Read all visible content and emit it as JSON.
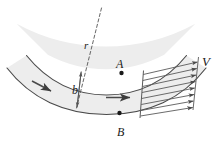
{
  "figure": {
    "labels": {
      "point_a": "A",
      "point_b": "B",
      "radius": "r",
      "width": "b",
      "velocity": "V"
    },
    "colors": {
      "fill": "#ededed",
      "stroke": "#4a4a4a",
      "arrow": "#4a4a4a",
      "dashed": "#555555",
      "text": "#1a1a1a",
      "background": "#ffffff"
    },
    "geometry": {
      "center_x": 106,
      "center_y": -62,
      "inner_radius": 124,
      "outer_radius": 186,
      "start_angle_deg": 118,
      "end_angle_deg": 58
    },
    "annotations": {
      "point_a_dot": "dot on inner (upper) wall at section A-B",
      "point_b_dot": "dot on outer (lower) wall at section A-B",
      "radius_line": "dashed radial line from center of curvature",
      "width_arrow": "double headed arrow across channel width b",
      "flow_arrows": "two solid arrows indicating flow direction",
      "velocity_profile": "eight horizontal arrows forming velocity profile V at outlet"
    },
    "counts": {
      "velocity_arrows": 8,
      "flow_arrows": 2
    }
  }
}
